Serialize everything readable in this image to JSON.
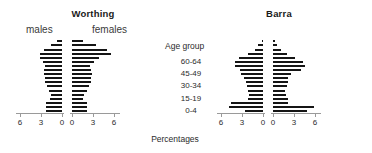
{
  "figure": {
    "xlabel": "Percentages",
    "age_group_title": "Age group",
    "age_group_ticks": [
      "60-64",
      "45-49",
      "30-34",
      "15-19",
      "0-4"
    ],
    "male_label": "males",
    "female_label": "females",
    "bar_color": "#151515",
    "axis_color": "#9a9a9a"
  },
  "panels": [
    {
      "title": "Worthing"
    },
    {
      "title": "Barra"
    }
  ],
  "axis": {
    "ticks": [
      6,
      3,
      0
    ],
    "tick_labels_left": [
      "6",
      "3",
      "0"
    ],
    "tick_labels_right": [
      "0",
      "3",
      "6"
    ],
    "max": 6
  },
  "chart_data": {
    "type": "bar",
    "subtype": "population-pyramid",
    "title": "",
    "xlabel": "Percentages",
    "ylabel": "Age group",
    "xlim": [
      0,
      6
    ],
    "grid": false,
    "legend_position": "inline-top",
    "categories": [
      "0-4",
      "5-9",
      "10-14",
      "15-19",
      "20-24",
      "25-29",
      "30-34",
      "35-39",
      "40-44",
      "45-49",
      "50-54",
      "55-59",
      "60-64",
      "65-69",
      "70-74",
      "75-79",
      "80-84",
      "85+"
    ],
    "panels": [
      {
        "name": "Worthing",
        "series": [
          {
            "name": "males",
            "values": [
              2.3,
              2.3,
              2.3,
              1.7,
              1.6,
              1.9,
              2.2,
              2.5,
              2.5,
              2.6,
              2.6,
              2.4,
              2.7,
              3.1,
              3.2,
              2.6,
              1.6,
              0.7
            ]
          },
          {
            "name": "females",
            "values": [
              2.2,
              2.2,
              2.2,
              1.6,
              1.7,
              2.1,
              2.4,
              2.7,
              2.7,
              2.8,
              2.7,
              2.6,
              3.1,
              3.9,
              5.6,
              5.0,
              3.4,
              1.5
            ]
          }
        ]
      },
      {
        "name": "Barra",
        "series": [
          {
            "name": "males",
            "values": [
              2.6,
              4.8,
              4.6,
              2.2,
              2.0,
              2.1,
              2.3,
              2.5,
              2.7,
              3.2,
              3.3,
              4.0,
              4.0,
              3.4,
              2.1,
              1.2,
              0.7,
              0.2
            ]
          },
          {
            "name": "females",
            "values": [
              4.9,
              5.8,
              2.2,
              2.1,
              1.8,
              1.7,
              2.0,
              2.1,
              2.2,
              2.6,
              4.0,
              4.6,
              4.3,
              3.1,
              2.0,
              1.2,
              0.6,
              0.3
            ]
          }
        ]
      }
    ]
  }
}
